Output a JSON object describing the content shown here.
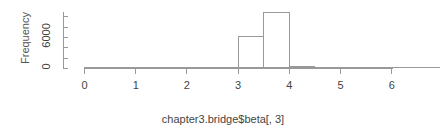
{
  "chart_data": {
    "type": "bar",
    "subtype": "histogram",
    "title": "",
    "xlabel": "chapter3.bridge$beta[, 3]",
    "ylabel": "Frequency",
    "xlim": [
      0,
      6.35
    ],
    "ylim": [
      0,
      11000
    ],
    "xticks": [
      "0",
      "1",
      "2",
      "3",
      "4",
      "5",
      "6"
    ],
    "xtick_values": [
      0,
      1,
      2,
      3,
      4,
      5,
      6
    ],
    "yticks": [
      "0",
      "6000"
    ],
    "ytick_values": [
      0,
      6000
    ],
    "ytick_marks": [
      0,
      2000,
      4000,
      6000,
      8000,
      10000
    ],
    "grid": false,
    "legend": false,
    "bin_width": 0.5,
    "bins": [
      {
        "x0": 3.0,
        "x1": 3.5,
        "count": 6100
      },
      {
        "x0": 3.5,
        "x1": 4.0,
        "count": 10800
      },
      {
        "x0": 4.0,
        "x1": 4.5,
        "count": 300
      }
    ],
    "categories": [
      "3.0-3.5",
      "3.5-4.0",
      "4.0-4.5"
    ],
    "values": [
      6100,
      10800,
      300
    ],
    "colors": {
      "axis": "#999999",
      "bar_border": "#999999",
      "bar_fill": "#ffffff",
      "text": "#444444",
      "background": "#ffffff"
    }
  }
}
